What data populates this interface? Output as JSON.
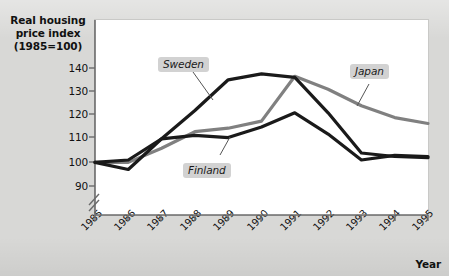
{
  "chart_data": {
    "type": "line",
    "title": "",
    "subtitle": "",
    "xlabel": "Year",
    "ylabel": "Real housing price index (1985=100)",
    "ylabel_lines": [
      "Real housing",
      "price index",
      "(1985=100)"
    ],
    "categories": [
      "1985",
      "1986",
      "1987",
      "1988",
      "1989",
      "1990",
      "1991",
      "1992",
      "1993",
      "1994",
      "1995"
    ],
    "x": [
      1985,
      1986,
      1987,
      1988,
      1989,
      1990,
      1991,
      1992,
      1993,
      1994,
      1995
    ],
    "xlim": [
      1985,
      1995
    ],
    "ylim": [
      88,
      145
    ],
    "yticks": [
      90,
      100,
      110,
      120,
      130,
      140
    ],
    "ytick_labels": [
      "90",
      "100",
      "110",
      "120",
      "130",
      "140"
    ],
    "y_axis_break": true,
    "grid": false,
    "legend": "inline-labels",
    "series": [
      {
        "name": "Sweden",
        "color": "#1a1a1a",
        "values": [
          100,
          97,
          110,
          122,
          135,
          137.5,
          136,
          121,
          104,
          102.5,
          102
        ]
      },
      {
        "name": "Finland",
        "color": "#1a1a1a",
        "values": [
          100,
          101,
          110,
          111.5,
          110.5,
          115,
          121,
          112,
          101,
          103,
          102.5
        ]
      },
      {
        "name": "Japan",
        "color": "#808080",
        "values": [
          100,
          100,
          106,
          113,
          114.5,
          117.5,
          136.5,
          131,
          124,
          119,
          116.5
        ]
      }
    ],
    "annotations": [
      {
        "label": "Sweden",
        "anchor_year": 1987,
        "anchor_value": 122
      },
      {
        "label": "Finland",
        "anchor_year": 1989,
        "anchor_value": 110.5
      },
      {
        "label": "Japan",
        "anchor_year": 1992,
        "anchor_value": 126
      }
    ]
  },
  "colors": {
    "background": "#d8d8d6",
    "plot_background": "#ffffff",
    "axis": "#6b6b6b",
    "text": "#111111",
    "label_box": "#d2d2d2",
    "series_dark": "#1a1a1a",
    "series_gray": "#808080"
  }
}
